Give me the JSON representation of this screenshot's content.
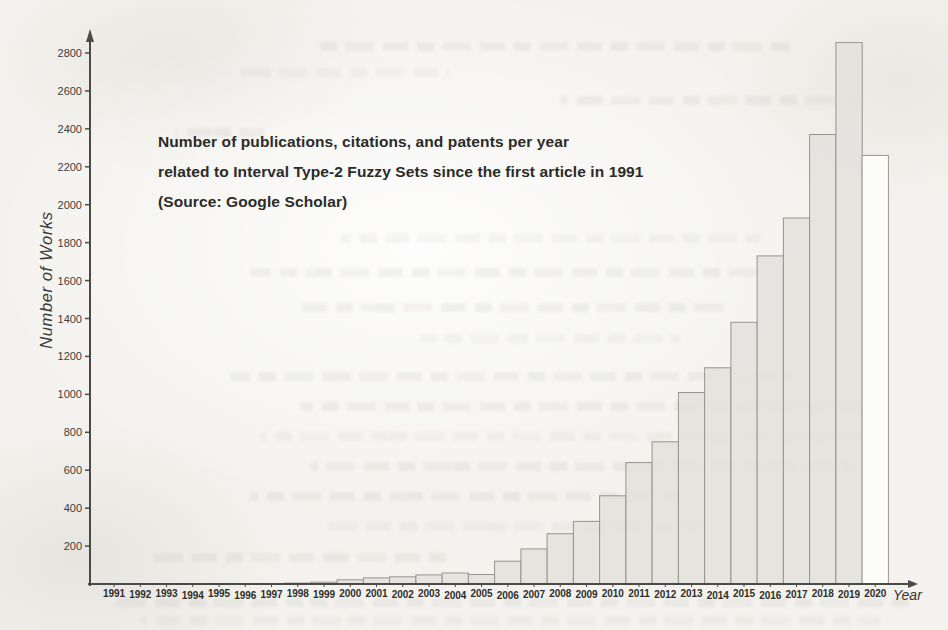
{
  "page": {
    "background_color": "#f3f2ee"
  },
  "chart_data": {
    "type": "bar",
    "title_lines": [
      "Number of publications, citations, and patents per year",
      "related to Interval Type-2 Fuzzy Sets since the first article in 1991",
      "(Source: Google Scholar)"
    ],
    "ylabel": "Number of Works",
    "xlabel": "Year",
    "categories": [
      "1991",
      "1992",
      "1993",
      "1994",
      "1995",
      "1996",
      "1997",
      "1998",
      "1999",
      "2000",
      "2001",
      "2002",
      "2003",
      "2004",
      "2005",
      "2006",
      "2007",
      "2008",
      "2009",
      "2010",
      "2011",
      "2012",
      "2013",
      "2014",
      "2015",
      "2016",
      "2017",
      "2018",
      "2019",
      "2020"
    ],
    "values": [
      0,
      0,
      0,
      0,
      0,
      0,
      0,
      5,
      10,
      22,
      32,
      38,
      48,
      58,
      50,
      120,
      185,
      265,
      330,
      465,
      640,
      750,
      1010,
      1140,
      1380,
      1730,
      1930,
      2370,
      2855,
      2260
    ],
    "ylim": [
      0,
      2900
    ],
    "yticks": [
      200,
      400,
      600,
      800,
      1000,
      1200,
      1400,
      1600,
      1800,
      2000,
      2200,
      2400,
      2600,
      2800
    ],
    "grid": false,
    "legend": "none",
    "bar_fill": "#e2e1dd",
    "bar_stroke": "#96958f",
    "last_bar_fill": "#fcfcf9",
    "axis_color": "#4a4a46",
    "tick_label_color": "#3d3d39",
    "year_label_color": "#2e2e2a",
    "title_color": "#2b2b28"
  }
}
